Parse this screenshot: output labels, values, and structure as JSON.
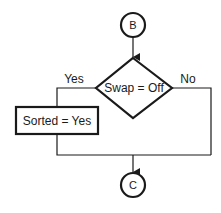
{
  "diagram": {
    "type": "flowchart",
    "nodes": {
      "start_connector": {
        "label": "B",
        "shape": "circle"
      },
      "decision": {
        "label": "Swap = Off",
        "shape": "diamond"
      },
      "process": {
        "label": "Sorted = Yes",
        "shape": "rectangle"
      },
      "end_connector": {
        "label": "C",
        "shape": "circle"
      }
    },
    "edges": {
      "yes_label": "Yes",
      "no_label": "No"
    },
    "colors": {
      "stroke": "#1a1a1a",
      "background": "#ffffff"
    }
  }
}
